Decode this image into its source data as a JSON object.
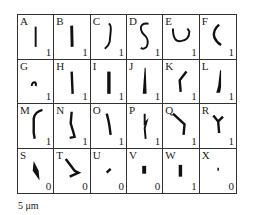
{
  "figure": {
    "panels": [
      {
        "letter": "A",
        "score": "1",
        "shape": "straight-thin-rod"
      },
      {
        "letter": "B",
        "score": "1",
        "shape": "straight-rod"
      },
      {
        "letter": "C",
        "score": "1",
        "shape": "s-curve-hook"
      },
      {
        "letter": "D",
        "score": "1",
        "shape": "s-curve"
      },
      {
        "letter": "E",
        "score": "1",
        "shape": "u-shape"
      },
      {
        "letter": "F",
        "score": "1",
        "shape": "c-curve"
      },
      {
        "letter": "G",
        "score": "1",
        "shape": "small-arc"
      },
      {
        "letter": "H",
        "score": "1",
        "shape": "straight-rod"
      },
      {
        "letter": "I",
        "score": "1",
        "shape": "thick-rod"
      },
      {
        "letter": "J",
        "score": "1",
        "shape": "tapered-rod"
      },
      {
        "letter": "K",
        "score": "1",
        "shape": "bent-rod"
      },
      {
        "letter": "L",
        "score": "1",
        "shape": "tapered-curved-rod"
      },
      {
        "letter": "M",
        "score": "1",
        "shape": "hooked-rod"
      },
      {
        "letter": "N",
        "score": "1",
        "shape": "j-shape"
      },
      {
        "letter": "O",
        "score": "1",
        "shape": "irregular-rod"
      },
      {
        "letter": "P",
        "score": "1",
        "shape": "zigzag-rod"
      },
      {
        "letter": "Q",
        "score": "1",
        "shape": "v-bent-rod"
      },
      {
        "letter": "R",
        "score": "1",
        "shape": "y-shape"
      },
      {
        "letter": "S",
        "score": "0",
        "shape": "diamond-blob"
      },
      {
        "letter": "T",
        "score": "0",
        "shape": "angled-l-shape"
      },
      {
        "letter": "U",
        "score": "0",
        "shape": "small-dash"
      },
      {
        "letter": "V",
        "score": "0",
        "shape": "short-block"
      },
      {
        "letter": "W",
        "score": "1",
        "shape": "short-block-tall"
      },
      {
        "letter": "X",
        "score": "0",
        "shape": "tiny-dot"
      }
    ],
    "scale_bar_label": "5 μm"
  }
}
